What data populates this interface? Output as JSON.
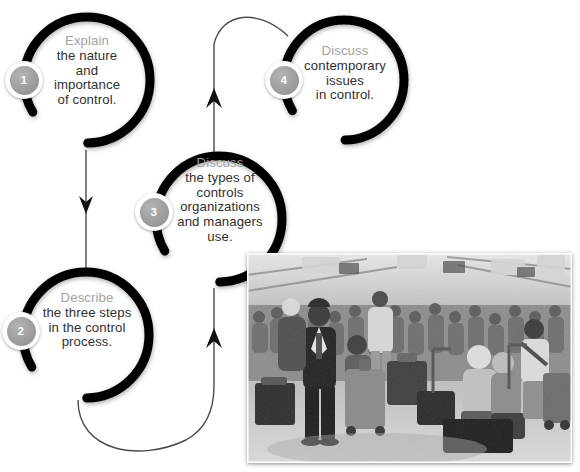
{
  "diagram": {
    "ring_color": "#000000",
    "lead_word_color": "#a2a2a2",
    "body_text_color": "#2f2f2f",
    "badge_color": "#9c9c9c",
    "nodes": [
      {
        "number": "1",
        "lead": "Explain",
        "body": "the nature\nand\nimportance\nof control."
      },
      {
        "number": "2",
        "lead": "Describe",
        "body": "the three steps\nin the control\nprocess."
      },
      {
        "number": "3",
        "lead": "Discuss",
        "body": "the types of\ncontrols\norganizations\nand managers\nuse."
      },
      {
        "number": "4",
        "lead": "Discuss",
        "body": "contemporary\nissues\nin control."
      }
    ]
  },
  "photo": {
    "caption_alt": "Crowded airport terminal with travelers waiting among luggage",
    "tone": "black-and-white"
  }
}
